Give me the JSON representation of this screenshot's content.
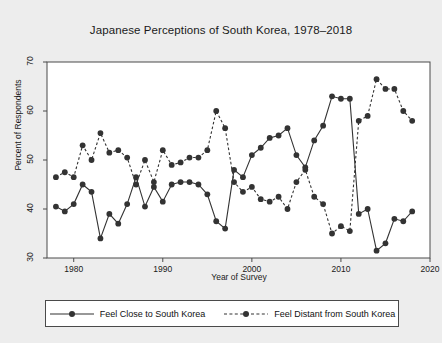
{
  "chart_data": {
    "type": "line",
    "title": "Japanese Perceptions of South Korea, 1978–2018",
    "xlabel": "Year of Survey",
    "ylabel": "Percent of Respondents",
    "xlim": [
      1977,
      2020
    ],
    "ylim": [
      30,
      70
    ],
    "xticks": [
      "1980",
      "1990",
      "2000",
      "2010",
      "2020"
    ],
    "xtick_values": [
      1980,
      1990,
      2000,
      2010,
      2020
    ],
    "yticks": [
      "30",
      "40",
      "50",
      "60",
      "70"
    ],
    "ytick_values": [
      30,
      40,
      50,
      60,
      70
    ],
    "grid": false,
    "legend_position": "below",
    "marker": "filled-circle",
    "series": [
      {
        "name": "Feel Close to South Korea",
        "style": "solid",
        "color": "#333333",
        "x": [
          1978,
          1979,
          1980,
          1981,
          1982,
          1983,
          1984,
          1985,
          1986,
          1987,
          1988,
          1989,
          1990,
          1991,
          1992,
          1993,
          1994,
          1995,
          1996,
          1997,
          1998,
          1999,
          2000,
          2001,
          2002,
          2003,
          2004,
          2005,
          2006,
          2007,
          2008,
          2009,
          2010,
          2011,
          2012,
          2013,
          2014,
          2015,
          2016,
          2017,
          2018
        ],
        "values": [
          40.5,
          39.5,
          41.0,
          45.0,
          43.5,
          34.0,
          39.0,
          37.0,
          41.0,
          46.5,
          40.5,
          44.5,
          41.5,
          45.0,
          45.5,
          45.5,
          45.0,
          43.0,
          37.5,
          36.0,
          48.0,
          46.5,
          51.0,
          52.5,
          54.5,
          55.0,
          56.5,
          51.0,
          48.5,
          54.0,
          57.0,
          63.0,
          62.5,
          62.5,
          39.0,
          40.0,
          31.5,
          33.0,
          38.0,
          37.5,
          39.5
        ]
      },
      {
        "name": "Feel Distant from South Korea",
        "style": "dashed",
        "color": "#333333",
        "x": [
          1978,
          1979,
          1980,
          1981,
          1982,
          1983,
          1984,
          1985,
          1986,
          1987,
          1988,
          1989,
          1990,
          1991,
          1992,
          1993,
          1994,
          1995,
          1996,
          1997,
          1998,
          1999,
          2000,
          2001,
          2002,
          2003,
          2004,
          2005,
          2006,
          2007,
          2008,
          2009,
          2010,
          2011,
          2012,
          2013,
          2014,
          2015,
          2016,
          2017,
          2018
        ],
        "values": [
          46.5,
          47.5,
          46.5,
          53.0,
          50.0,
          55.5,
          51.5,
          52.0,
          50.5,
          45.0,
          50.0,
          45.5,
          52.0,
          49.0,
          49.5,
          50.5,
          50.5,
          52.0,
          60.0,
          56.5,
          45.5,
          43.5,
          44.5,
          42.0,
          41.5,
          42.5,
          40.0,
          45.5,
          48.0,
          42.5,
          41.0,
          35.0,
          36.5,
          35.5,
          58.0,
          59.0,
          66.5,
          64.5,
          64.5,
          60.0,
          58.0
        ]
      }
    ]
  },
  "legend": {
    "entries": [
      {
        "label": "Feel Close to South Korea"
      },
      {
        "label": "Feel Distant from South Korea"
      }
    ]
  }
}
